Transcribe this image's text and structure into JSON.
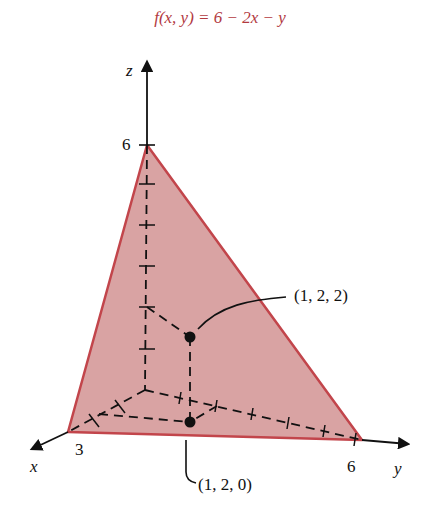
{
  "title": "f(x, y) = 6 − 2x − y",
  "colors": {
    "title": "#b23a3f",
    "plane_fill": "#d9a3a3",
    "plane_edge": "#c2454b",
    "axis": "#111111"
  },
  "axes": {
    "x": {
      "label": "x",
      "tick_value": "3"
    },
    "y": {
      "label": "y",
      "tick_value": "6"
    },
    "z": {
      "label": "z",
      "tick_value": "6"
    }
  },
  "points": [
    {
      "label": "(1, 2, 2)",
      "coords": [
        1,
        2,
        2
      ]
    },
    {
      "label": "(1, 2, 0)",
      "coords": [
        1,
        2,
        0
      ]
    }
  ],
  "plane": {
    "equation": "z = 6 - 2x - y",
    "vertices": [
      [
        3,
        0,
        0
      ],
      [
        0,
        6,
        0
      ],
      [
        0,
        0,
        6
      ]
    ]
  }
}
